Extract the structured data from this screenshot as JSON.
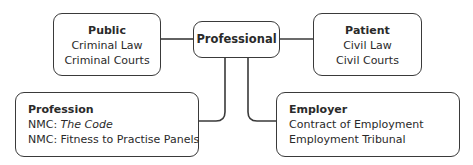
{
  "diagram": {
    "center": {
      "title": "Professional"
    },
    "public": {
      "title": "Public",
      "lines": [
        "Criminal Law",
        "Criminal Courts"
      ]
    },
    "patient": {
      "title": "Patient",
      "lines": [
        "Civil Law",
        "Civil Courts"
      ]
    },
    "profession": {
      "title": "Profession",
      "line1_prefix": "NMC: ",
      "line1_italic": "The Code",
      "line2": "NMC: Fitness to Practise Panels"
    },
    "employer": {
      "title": "Employer",
      "lines": [
        "Contract of Employment",
        "Employment Tribunal"
      ]
    },
    "colors": {
      "stroke": "#3a3a3a",
      "text": "#2a2a2a",
      "background": "#ffffff"
    }
  }
}
